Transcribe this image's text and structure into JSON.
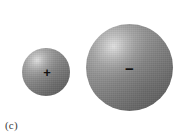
{
  "figure": {
    "caption": "(c)",
    "background_color": "#ffffff",
    "width": 195,
    "height": 138
  },
  "objects": [
    {
      "name": "small-sphere",
      "charge_label": "+",
      "charge_sign": "positive",
      "diameter_px": 48,
      "center_x": 46,
      "center_y": 72,
      "fill_color": "#8a8a8a",
      "highlight_color": "#e2e2e2",
      "shadow_color": "#585858",
      "label_color": "#111111"
    },
    {
      "name": "large-sphere",
      "charge_label": "−",
      "charge_sign": "negative",
      "diameter_px": 87,
      "center_x": 130,
      "center_y": 68,
      "fill_color": "#8a8a8a",
      "highlight_color": "#e2e2e2",
      "shadow_color": "#585858",
      "label_color": "#111111"
    }
  ]
}
